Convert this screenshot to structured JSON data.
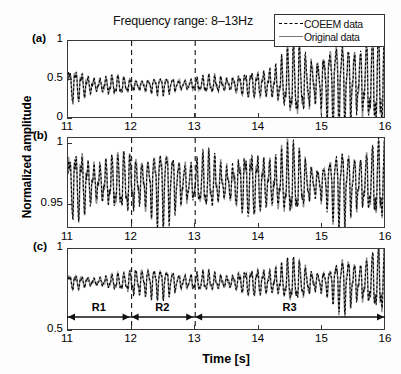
{
  "chart_data": {
    "type": "line",
    "title": "Frequency range: 8–13Hz",
    "xlabel": "Time [s]",
    "ylabel": "Normalized amplitude",
    "xlim": [
      11,
      16
    ],
    "xticks": [
      "11",
      "12",
      "13",
      "14",
      "15",
      "16"
    ],
    "grid": false,
    "legend_position": "top-right",
    "legend": [
      {
        "name": "COEEM data",
        "style": "dashed",
        "color": "#000000"
      },
      {
        "name": "Original data",
        "style": "solid",
        "color": "#808080"
      }
    ],
    "markers": {
      "dashed_vertical_lines": [
        12,
        13
      ]
    },
    "regions": [
      {
        "label": "R1",
        "start": 11,
        "end": 12
      },
      {
        "label": "R2",
        "start": 12,
        "end": 13
      },
      {
        "label": "R3",
        "start": 13,
        "end": 16
      }
    ],
    "panels": [
      {
        "id": "a",
        "label": "(a)",
        "ylim": [
          0,
          1
        ],
        "yticks": [
          "0",
          "0.5",
          "1"
        ],
        "ytick_values": [
          0,
          0.5,
          1
        ],
        "baseline": 0.44,
        "carrier_hz": 10.5,
        "envelope_x": [
          11.0,
          11.3,
          11.6,
          12.0,
          12.4,
          12.8,
          13.1,
          13.4,
          13.7,
          14.0,
          14.3,
          14.6,
          14.9,
          15.2,
          15.5,
          15.8,
          16.0
        ],
        "envelope_y": [
          0.17,
          0.15,
          0.14,
          0.09,
          0.08,
          0.08,
          0.09,
          0.14,
          0.12,
          0.13,
          0.27,
          0.44,
          0.52,
          0.52,
          0.47,
          0.52,
          0.55
        ],
        "trend_x": [
          11.0,
          12.0,
          13.0,
          14.0,
          14.6,
          15.2,
          16.0
        ],
        "trend_y": [
          0.0,
          -0.01,
          0.0,
          0.01,
          0.03,
          0.04,
          0.05
        ]
      },
      {
        "id": "b",
        "label": "(b)",
        "ylim": [
          0.93,
          1.005
        ],
        "yticks": [
          "0.95",
          "1"
        ],
        "ytick_values": [
          0.95,
          1
        ],
        "baseline": 0.968,
        "carrier_hz": 10.5,
        "envelope_x": [
          11.0,
          11.2,
          11.5,
          11.8,
          12.0,
          12.2,
          12.5,
          12.8,
          13.0,
          13.3,
          13.6,
          14.0,
          14.3,
          14.6,
          15.0,
          15.3,
          15.6,
          16.0
        ],
        "envelope_y": [
          0.019,
          0.024,
          0.026,
          0.021,
          0.03,
          0.022,
          0.023,
          0.024,
          0.019,
          0.025,
          0.022,
          0.02,
          0.024,
          0.026,
          0.022,
          0.027,
          0.024,
          0.026
        ],
        "trend_x": [
          11.0,
          12.0,
          13.0,
          14.0,
          15.0,
          16.0
        ],
        "trend_y": [
          0.0,
          0.0,
          0.0,
          0.0,
          0.0,
          0.0
        ]
      },
      {
        "id": "c",
        "label": "(c)",
        "ylim": [
          0.5,
          1
        ],
        "yticks": [
          "0.5",
          "1"
        ],
        "ytick_values": [
          0.5,
          1
        ],
        "baseline": 0.8,
        "carrier_hz": 10.5,
        "envelope_x": [
          11.0,
          11.3,
          11.6,
          11.9,
          12.05,
          12.2,
          12.4,
          12.7,
          13.0,
          13.3,
          13.6,
          13.9,
          14.2,
          14.5,
          14.8,
          15.1,
          15.35,
          15.6,
          15.8,
          16.0
        ],
        "envelope_y": [
          0.035,
          0.033,
          0.045,
          0.05,
          0.115,
          0.095,
          0.07,
          0.058,
          0.055,
          0.06,
          0.058,
          0.06,
          0.085,
          0.11,
          0.118,
          0.09,
          0.15,
          0.13,
          0.145,
          0.16
        ],
        "trend_x": [
          11.0,
          12.0,
          13.0,
          14.0,
          15.0,
          16.0
        ],
        "trend_y": [
          0.0,
          0.0,
          0.0,
          0.0,
          0.0,
          0.0
        ]
      }
    ]
  },
  "layout": {
    "plot_left": 67,
    "plot_right": 385,
    "panel_a_top": 40,
    "panel_a_bottom": 118,
    "panel_b_top": 137,
    "panel_b_bottom": 228,
    "panel_c_top": 248,
    "panel_c_bottom": 330
  }
}
